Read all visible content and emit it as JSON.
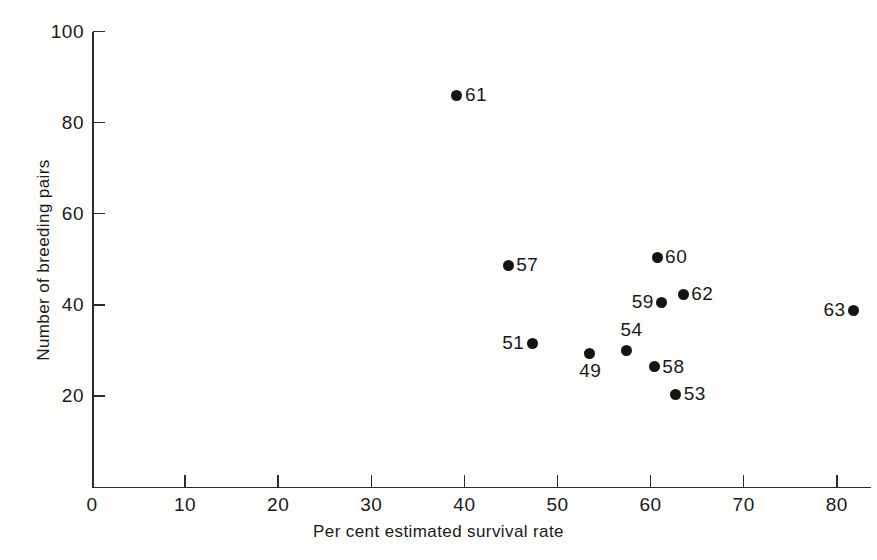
{
  "chart_data": {
    "type": "scatter",
    "title": "",
    "xlabel": "Per cent estimated survival rate",
    "ylabel": "Number of breeding pairs",
    "xlim": [
      0,
      83.7
    ],
    "ylim": [
      0,
      100
    ],
    "grid": false,
    "legend": null,
    "xticks": [
      0,
      10,
      20,
      30,
      40,
      50,
      60,
      70,
      80
    ],
    "xtick_labels": [
      "0",
      "10",
      "20",
      "30",
      "40",
      "50",
      "60",
      "70",
      "80"
    ],
    "yticks": [
      20,
      40,
      60,
      80,
      100
    ],
    "ytick_labels": [
      "20",
      "40",
      "60",
      "80",
      "100"
    ],
    "point_labels": [
      "49",
      "51",
      "53",
      "54",
      "57",
      "58",
      "59",
      "60",
      "61",
      "62",
      "63"
    ],
    "points": [
      {
        "label": "61",
        "x": 39.2,
        "y": 86.0,
        "label_pos": "right"
      },
      {
        "label": "57",
        "x": 44.7,
        "y": 48.7,
        "label_pos": "right"
      },
      {
        "label": "60",
        "x": 60.7,
        "y": 50.4,
        "label_pos": "right"
      },
      {
        "label": "59",
        "x": 61.2,
        "y": 40.6,
        "label_pos": "left"
      },
      {
        "label": "62",
        "x": 63.5,
        "y": 42.3,
        "label_pos": "right"
      },
      {
        "label": "63",
        "x": 81.8,
        "y": 38.8,
        "label_pos": "left"
      },
      {
        "label": "51",
        "x": 47.3,
        "y": 31.6,
        "label_pos": "left"
      },
      {
        "label": "54",
        "x": 57.4,
        "y": 30.0,
        "label_pos": "above"
      },
      {
        "label": "49",
        "x": 53.4,
        "y": 29.4,
        "label_pos": "below"
      },
      {
        "label": "58",
        "x": 60.4,
        "y": 26.4,
        "label_pos": "right"
      },
      {
        "label": "53",
        "x": 62.7,
        "y": 20.4,
        "label_pos": "right"
      }
    ]
  },
  "colors": {
    "marker": "#141414",
    "axis": "#2b2b2b",
    "text": "#1a1a1a",
    "background": "#fdfdfc"
  }
}
